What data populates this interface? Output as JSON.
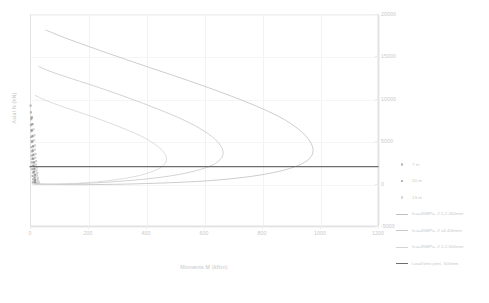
{
  "chart_data": {
    "type": "scatter",
    "title": "",
    "xlabel": "Moments M (kNm)",
    "ylabel": "Axial N (kN)",
    "xlim": [
      0,
      1200
    ],
    "ylim": [
      -5000,
      20000
    ],
    "xticks": [
      "0",
      "200",
      "400",
      "600",
      "800",
      "1000",
      "1200"
    ],
    "xtick_values": [
      0,
      200,
      400,
      600,
      800,
      1000,
      1200
    ],
    "yticks": [
      "20000",
      "15000",
      "10000",
      "5000",
      "0",
      "-5000"
    ],
    "ytick_values": [
      20000,
      15000,
      10000,
      5000,
      0,
      -5000
    ],
    "grid": true,
    "y_axis_labels_position": "right",
    "legend_position": "right",
    "annotations": [],
    "series": [
      {
        "name": "7 m",
        "type": "scatter",
        "marker": "square",
        "color": "#b9b9b9",
        "points": [
          [
            2,
            9200
          ],
          [
            3,
            8400
          ],
          [
            4,
            7600
          ],
          [
            3,
            6900
          ],
          [
            5,
            6200
          ],
          [
            4,
            5500
          ],
          [
            6,
            4900
          ],
          [
            5,
            4300
          ],
          [
            7,
            3800
          ],
          [
            6,
            3300
          ],
          [
            8,
            2900
          ],
          [
            7,
            2500
          ],
          [
            9,
            2100
          ],
          [
            8,
            1700
          ],
          [
            10,
            1300
          ],
          [
            9,
            900
          ],
          [
            11,
            500
          ],
          [
            10,
            150
          ]
        ]
      },
      {
        "name": "10 m",
        "type": "scatter",
        "marker": "square",
        "color": "#9a9a9a",
        "points": [
          [
            6,
            7800
          ],
          [
            8,
            7000
          ],
          [
            7,
            6300
          ],
          [
            9,
            5600
          ],
          [
            8,
            5000
          ],
          [
            11,
            4400
          ],
          [
            10,
            3900
          ],
          [
            12,
            3400
          ],
          [
            11,
            2950
          ],
          [
            14,
            2500
          ],
          [
            13,
            2100
          ],
          [
            15,
            1750
          ],
          [
            14,
            1400
          ],
          [
            17,
            1050
          ],
          [
            16,
            720
          ],
          [
            18,
            420
          ],
          [
            17,
            180
          ],
          [
            19,
            60
          ]
        ]
      },
      {
        "name": "13 m",
        "type": "scatter",
        "marker": "square",
        "color": "#d0d0d0",
        "points": [
          [
            12,
            6400
          ],
          [
            15,
            5700
          ],
          [
            14,
            5100
          ],
          [
            17,
            4500
          ],
          [
            16,
            4000
          ],
          [
            19,
            3500
          ],
          [
            18,
            3050
          ],
          [
            21,
            2650
          ],
          [
            20,
            2250
          ],
          [
            23,
            1900
          ],
          [
            22,
            1550
          ],
          [
            25,
            1250
          ],
          [
            24,
            950
          ],
          [
            27,
            680
          ],
          [
            26,
            430
          ],
          [
            29,
            230
          ],
          [
            28,
            90
          ],
          [
            30,
            30
          ]
        ]
      },
      {
        "name": "fcu=45MPa, 2.1,2.450mm",
        "type": "line",
        "color": "#c0c0c0",
        "width": 0.8,
        "curve_points": [
          [
            55,
            18100
          ],
          [
            120,
            17200
          ],
          [
            200,
            16200
          ],
          [
            300,
            15000
          ],
          [
            420,
            13600
          ],
          [
            550,
            12100
          ],
          [
            680,
            10500
          ],
          [
            790,
            9000
          ],
          [
            880,
            7500
          ],
          [
            940,
            6000
          ],
          [
            970,
            4700
          ],
          [
            975,
            3600
          ],
          [
            955,
            2700
          ],
          [
            910,
            1950
          ],
          [
            840,
            1300
          ],
          [
            740,
            750
          ],
          [
            620,
            350
          ],
          [
            480,
            100
          ],
          [
            330,
            -60
          ],
          [
            190,
            -120
          ],
          [
            80,
            -100
          ],
          [
            20,
            -40
          ]
        ]
      },
      {
        "name": "fcu=45MPa, 2 s6,400mm",
        "type": "line",
        "color": "#c8c8c8",
        "width": 0.8,
        "curve_points": [
          [
            30,
            13800
          ],
          [
            80,
            13100
          ],
          [
            150,
            12300
          ],
          [
            240,
            11300
          ],
          [
            340,
            10100
          ],
          [
            440,
            8800
          ],
          [
            530,
            7500
          ],
          [
            600,
            6200
          ],
          [
            645,
            5000
          ],
          [
            665,
            3900
          ],
          [
            660,
            3000
          ],
          [
            630,
            2200
          ],
          [
            575,
            1550
          ],
          [
            500,
            1000
          ],
          [
            410,
            580
          ],
          [
            310,
            270
          ],
          [
            210,
            60
          ],
          [
            120,
            -40
          ],
          [
            50,
            -70
          ],
          [
            10,
            -30
          ]
        ]
      },
      {
        "name": "fcu=35MPa, 2.1,2.500mm",
        "type": "line",
        "color": "#d4d4d4",
        "width": 0.8,
        "curve_points": [
          [
            18,
            10400
          ],
          [
            55,
            9800
          ],
          [
            110,
            9100
          ],
          [
            180,
            8300
          ],
          [
            255,
            7400
          ],
          [
            330,
            6400
          ],
          [
            395,
            5400
          ],
          [
            440,
            4400
          ],
          [
            465,
            3500
          ],
          [
            470,
            2700
          ],
          [
            455,
            2000
          ],
          [
            420,
            1400
          ],
          [
            370,
            900
          ],
          [
            305,
            500
          ],
          [
            235,
            220
          ],
          [
            160,
            30
          ],
          [
            90,
            -60
          ],
          [
            35,
            -70
          ],
          [
            8,
            -25
          ]
        ]
      },
      {
        "name": "Load limit joint, 500mm",
        "type": "line",
        "color": "#6e6e6e",
        "width": 1.3,
        "horizontal_value": 2000,
        "curve_points": [
          [
            0,
            2000
          ],
          [
            1200,
            2000
          ]
        ]
      }
    ],
    "legend_entries": [
      {
        "label": "7 m",
        "marker": "square",
        "color": "#b9b9b9"
      },
      {
        "label": "10 m",
        "marker": "square",
        "color": "#9a9a9a"
      },
      {
        "label": "13 m",
        "marker": "square",
        "color": "#d0d0d0"
      },
      {
        "label": "fcu=45MPa, 2.1,2.450mm",
        "marker": "line",
        "color": "#c0c0c0"
      },
      {
        "label": "fcu=45MPa, 2 s6,400mm",
        "marker": "line",
        "color": "#c8c8c8"
      },
      {
        "label": "fcu=35MPa, 2.1,2.500mm",
        "marker": "line",
        "color": "#d4d4d4"
      },
      {
        "label": "Load limit joint, 500mm",
        "marker": "line-thick",
        "color": "#6e6e6e"
      }
    ]
  }
}
